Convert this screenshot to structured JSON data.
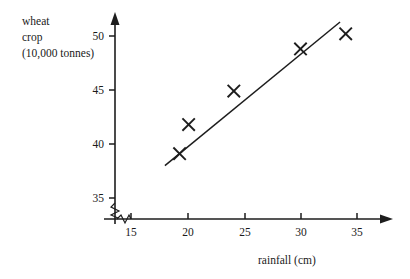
{
  "chart_data": {
    "type": "scatter",
    "title": "",
    "xlabel": "rainfall (cm)",
    "ylabel": "wheat crop (10,000 tonnes)",
    "ylabel_lines": [
      "wheat",
      "crop",
      "(10,000 tonnes)"
    ],
    "x": [
      19.3,
      20.1,
      24.1,
      30.0,
      34.0
    ],
    "y": [
      39.1,
      41.8,
      44.9,
      48.8,
      50.2
    ],
    "points": [
      {
        "x": 19.3,
        "y": 39.1
      },
      {
        "x": 20.1,
        "y": 41.8
      },
      {
        "x": 24.1,
        "y": 44.9
      },
      {
        "x": 30.0,
        "y": 48.8
      },
      {
        "x": 34.0,
        "y": 50.2
      }
    ],
    "marker": "x-cross",
    "xticks": [
      15,
      20,
      25,
      30,
      35
    ],
    "xtick_labels": [
      "15",
      "20",
      "25",
      "30",
      "35"
    ],
    "yticks": [
      35,
      40,
      45,
      50
    ],
    "ytick_labels": [
      "35",
      "40",
      "45",
      "50"
    ],
    "xlim": [
      12.2,
      37.5
    ],
    "ylim": [
      33.0,
      51.8
    ],
    "grid": false,
    "legend": "none",
    "axis_break_y": true,
    "axis_break_x": true,
    "axis_break_note": "zigzag break symbol on both axes near the origin",
    "trend_line": {
      "name": "line of best fit",
      "x_start": 18.0,
      "y_start": 38.0,
      "x_end": 33.5,
      "y_end": 51.3
    },
    "colors": {
      "ink": "#1d1d1d",
      "background": "#ffffff"
    }
  },
  "axes": {
    "y_title_lines": [
      "wheat",
      "crop",
      "(10,000 tonnes)"
    ],
    "x_title": "rainfall (cm)",
    "y_tick_50": "50",
    "y_tick_45": "45",
    "y_tick_40": "40",
    "y_tick_35": "35",
    "x_tick_15": "15",
    "x_tick_20": "20",
    "x_tick_25": "25",
    "x_tick_30": "30",
    "x_tick_35": "35"
  }
}
